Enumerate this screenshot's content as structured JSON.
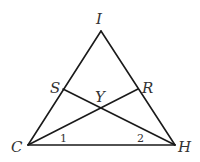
{
  "diagram": {
    "type": "geometry-triangle",
    "points": {
      "I": {
        "label": "I",
        "x": 101,
        "y": 31
      },
      "C": {
        "label": "C",
        "x": 28,
        "y": 145
      },
      "H": {
        "label": "H",
        "x": 175,
        "y": 145
      },
      "S": {
        "label": "S",
        "x": 63,
        "y": 89
      },
      "R": {
        "label": "R",
        "x": 138,
        "y": 89
      },
      "Y": {
        "label": "Y",
        "x": 101,
        "y": 107
      }
    },
    "segments": [
      "IC",
      "IH",
      "CH",
      "SH",
      "CR"
    ],
    "angles": [
      {
        "label": "1",
        "vertex": "C"
      },
      {
        "label": "2",
        "vertex": "H"
      }
    ]
  }
}
